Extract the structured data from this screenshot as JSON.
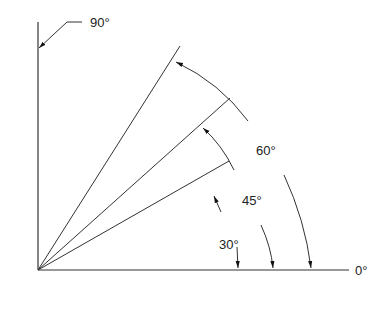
{
  "diagram": {
    "labels": {
      "deg90": "90°",
      "deg60": "60°",
      "deg45": "45°",
      "deg30": "30°",
      "deg0": "0°"
    },
    "angles": [
      0,
      30,
      45,
      60,
      90
    ],
    "line_color": "#333333"
  }
}
